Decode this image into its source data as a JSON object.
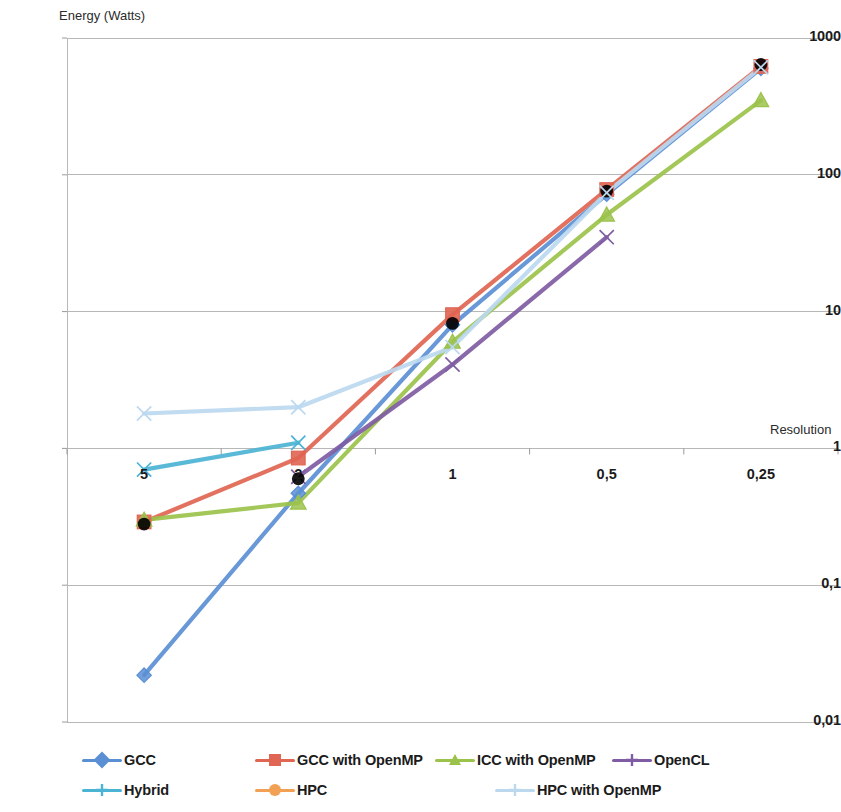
{
  "chart_data": {
    "type": "line",
    "title": "",
    "ylabel": "Energy (Watts)",
    "xlabel": "Resolution",
    "categories": [
      "5",
      "2",
      "1",
      "0,5",
      "0,25"
    ],
    "yticks": [
      "1000",
      "100",
      "10",
      "1",
      "0,1",
      "0,01"
    ],
    "ytick_values": [
      1000,
      100,
      10,
      1,
      0.1,
      0.01
    ],
    "ylim": [
      0.01,
      1000
    ],
    "yscale": "log",
    "grid": true,
    "legend_position": "bottom",
    "series": [
      {
        "name": "GCC",
        "color": "#5b8fd4",
        "marker": "diamond",
        "values": [
          0.022,
          0.47,
          8.0,
          72.0,
          600.0
        ]
      },
      {
        "name": "GCC with OpenMP",
        "color": "#e06552",
        "marker": "square",
        "values": [
          0.29,
          0.85,
          9.5,
          78.0,
          620.0
        ]
      },
      {
        "name": "ICC with OpenMP",
        "color": "#9bc24b",
        "marker": "triangle",
        "values": [
          0.3,
          0.4,
          6.0,
          51.0,
          350.0
        ]
      },
      {
        "name": "OpenCL",
        "color": "#7f5ca3",
        "marker": "cross",
        "values": [
          null,
          0.62,
          4.1,
          35.0,
          null
        ]
      },
      {
        "name": "Hybrid",
        "color": "#4bb3d4",
        "marker": "cross",
        "values": [
          0.7,
          1.1,
          null,
          null,
          null
        ]
      },
      {
        "name": "HPC",
        "color": "#f5a council",
        "marker": "circle",
        "values": [
          0.28,
          0.6,
          8.2,
          76.0,
          640.0
        ]
      },
      {
        "name": "HPC with OpenMP",
        "color": "#bcd8ef",
        "marker": "cross",
        "values": [
          1.8,
          2.0,
          5.5,
          74.0,
          610.0
        ]
      }
    ]
  },
  "legend": {
    "items": [
      {
        "label": "GCC",
        "color": "#5b8fd4",
        "marker": "diamond"
      },
      {
        "label": "GCC with OpenMP",
        "color": "#e06552",
        "marker": "square"
      },
      {
        "label": "ICC with OpenMP",
        "color": "#9bc24b",
        "marker": "triangle"
      },
      {
        "label": "OpenCL",
        "color": "#7f5ca3",
        "marker": "cross"
      },
      {
        "label": "Hybrid",
        "color": "#4bb3d4",
        "marker": "cross"
      },
      {
        "label": "HPC",
        "color": "#f2a154",
        "marker": "circle"
      },
      {
        "label": "HPC with OpenMP",
        "color": "#bcd8ef",
        "marker": "cross"
      }
    ]
  }
}
